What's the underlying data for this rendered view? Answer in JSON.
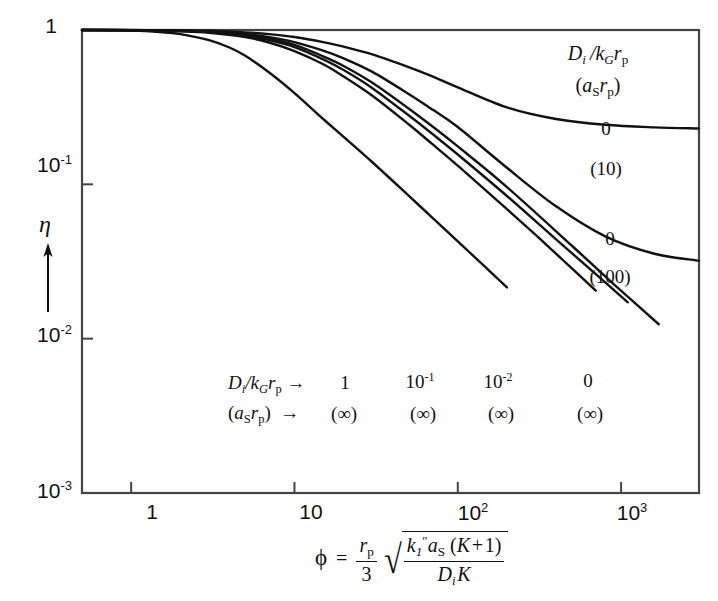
{
  "figure": {
    "background_color": "#ffffff",
    "line_color": "#111111",
    "axis_color": "#444444"
  },
  "axes": {
    "x": {
      "label_parts": {
        "phi": "ϕ",
        "equals": "=",
        "prefactor_num": "r",
        "prefactor_num_sub": "p",
        "prefactor_den": "3",
        "radicand_num": "k₁″aₛ(K+1)",
        "radicand_den": "DᵢK"
      },
      "ticks": [
        "1",
        "10",
        "10",
        "10"
      ],
      "tick_exponents": [
        "",
        "",
        "2",
        "3"
      ],
      "tick_values": [
        1,
        10,
        100,
        1000
      ],
      "range": [
        0.5,
        3000
      ],
      "scale": "log"
    },
    "y": {
      "label": "η",
      "ticks": [
        "1",
        "10",
        "10",
        "10"
      ],
      "tick_exponents": [
        "",
        "-1",
        "-2",
        "-3"
      ],
      "tick_values": [
        1,
        0.1,
        0.01,
        0.001
      ],
      "range": [
        0.001,
        1
      ],
      "scale": "log",
      "arrow": "up-arrow"
    }
  },
  "legend_top": {
    "header_line1": "Dᵢ/k_G r_p",
    "header_line2": "(a_S r_p)",
    "entries": [
      {
        "top": "0",
        "bottom": "(10)"
      },
      {
        "top": "0",
        "bottom": "(100)"
      }
    ]
  },
  "legend_bottom": {
    "header_line1": "Dᵢ/k_G r_p →",
    "header_line2": "(a_S r_p)   →",
    "entries": [
      {
        "top": "1",
        "bottom": "(∞)"
      },
      {
        "top": "10",
        "top_exp": "-1",
        "bottom": "(∞)"
      },
      {
        "top": "10",
        "top_exp": "-2",
        "bottom": "(∞)"
      },
      {
        "top": "0",
        "bottom": "(∞)"
      }
    ]
  },
  "chart_data": {
    "type": "line",
    "title": "",
    "xlabel": "ϕ = (r_p/3)√[k₁″a_S(K+1)/(DᵢK)]",
    "ylabel": "η",
    "xscale": "log",
    "yscale": "log",
    "xlim": [
      0.5,
      3000
    ],
    "ylim": [
      0.001,
      1
    ],
    "grid": false,
    "legend_position": "in-plot annotations",
    "series": [
      {
        "name": "D_i/k_G r_p -> 1, (a_S r_p) -> (inf)",
        "label_top": "1",
        "label_bottom": "(∞)",
        "x": [
          0.5,
          1,
          1.5,
          2,
          3,
          4,
          5,
          7,
          10,
          15,
          20,
          30,
          50,
          70,
          100,
          150,
          200
        ],
        "y": [
          1.0,
          0.99,
          0.97,
          0.94,
          0.86,
          0.77,
          0.68,
          0.53,
          0.39,
          0.265,
          0.203,
          0.139,
          0.0845,
          0.0607,
          0.0427,
          0.0286,
          0.0215
        ]
      },
      {
        "name": "D_i/k_G r_p = 10^-1, (a_S r_p) -> (inf)",
        "label_top": "10",
        "label_top_exp": "-1",
        "label_bottom": "(∞)",
        "x": [
          0.5,
          1,
          2,
          3,
          5,
          7,
          10,
          15,
          20,
          30,
          50,
          70,
          100,
          200,
          300,
          500,
          700
        ],
        "y": [
          1.0,
          0.995,
          0.98,
          0.96,
          0.9,
          0.83,
          0.73,
          0.6,
          0.5,
          0.375,
          0.245,
          0.182,
          0.132,
          0.069,
          0.047,
          0.0285,
          0.0205
        ]
      },
      {
        "name": "D_i/k_G r_p = 10^-2, (a_S r_p) -> (inf)",
        "label_top": "10",
        "label_top_exp": "-2",
        "label_bottom": "(∞)",
        "x": [
          0.5,
          1,
          2,
          3,
          5,
          7,
          10,
          15,
          20,
          30,
          50,
          70,
          100,
          200,
          400,
          700,
          1100
        ],
        "y": [
          1.0,
          0.997,
          0.985,
          0.97,
          0.92,
          0.86,
          0.775,
          0.645,
          0.55,
          0.42,
          0.28,
          0.212,
          0.156,
          0.084,
          0.044,
          0.0262,
          0.0172
        ]
      },
      {
        "name": "D_i/k_G r_p = 0, (a_S r_p) -> (inf)",
        "label_top": "0",
        "label_bottom": "(∞)",
        "x": [
          0.5,
          1,
          2,
          3,
          5,
          7,
          10,
          15,
          20,
          30,
          50,
          70,
          100,
          200,
          500,
          900,
          1700
        ],
        "y": [
          1.0,
          0.998,
          0.99,
          0.975,
          0.935,
          0.88,
          0.8,
          0.675,
          0.585,
          0.455,
          0.31,
          0.237,
          0.176,
          0.096,
          0.04,
          0.0226,
          0.0124
        ]
      },
      {
        "name": "D_i/k_G r_p = 0, (a_S r_p) = 10",
        "label_top": "0",
        "label_bottom": "(10)",
        "x": [
          0.5,
          1,
          2,
          3,
          5,
          7,
          10,
          15,
          20,
          30,
          50,
          70,
          100,
          200,
          400,
          800,
          1600,
          3000
        ],
        "y": [
          1.0,
          0.999,
          0.995,
          0.988,
          0.965,
          0.94,
          0.9,
          0.835,
          0.78,
          0.695,
          0.575,
          0.5,
          0.425,
          0.315,
          0.265,
          0.243,
          0.234,
          0.23
        ]
      },
      {
        "name": "D_i/k_G r_p = 0, (a_S r_p) = 100",
        "label_top": "0",
        "label_bottom": "(100)",
        "x": [
          0.5,
          1,
          2,
          3,
          5,
          7,
          10,
          15,
          20,
          30,
          50,
          70,
          100,
          200,
          400,
          800,
          1600,
          3000
        ],
        "y": [
          1.0,
          0.998,
          0.99,
          0.978,
          0.943,
          0.9,
          0.835,
          0.735,
          0.655,
          0.535,
          0.385,
          0.305,
          0.235,
          0.128,
          0.072,
          0.046,
          0.0355,
          0.032
        ]
      }
    ]
  }
}
